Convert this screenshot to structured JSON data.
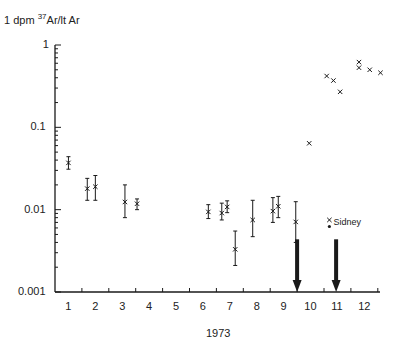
{
  "chart_data": {
    "type": "scatter",
    "title": "",
    "ylabel": "1 dpm 37Ar/lt Ar",
    "ylabel_parts": {
      "prefix": "1 dpm ",
      "sup": "37",
      "suffix": "Ar/lt Ar"
    },
    "xlabel": "1973",
    "yscale": "log",
    "ylim": [
      0.001,
      1
    ],
    "xlim": [
      0,
      12.3
    ],
    "y_ticks": [
      {
        "value": 1,
        "label": "1"
      },
      {
        "value": 0.1,
        "label": "0.1"
      },
      {
        "value": 0.01,
        "label": "0.01"
      },
      {
        "value": 0.001,
        "label": "0.001"
      }
    ],
    "x_tick_labels": [
      "1",
      "2",
      "3",
      "4",
      "5",
      "6",
      "7",
      "8",
      "9",
      "10",
      "11",
      "12"
    ],
    "grid": false,
    "series": [
      {
        "name": "measurements",
        "marker": "x",
        "points": [
          {
            "x": 0.5,
            "y": 0.037,
            "ylo": 0.031,
            "yhi": 0.044
          },
          {
            "x": 1.2,
            "y": 0.018,
            "ylo": 0.013,
            "yhi": 0.024
          },
          {
            "x": 1.5,
            "y": 0.019,
            "ylo": 0.013,
            "yhi": 0.026
          },
          {
            "x": 2.6,
            "y": 0.0124,
            "ylo": 0.008,
            "yhi": 0.02
          },
          {
            "x": 3.05,
            "y": 0.0118,
            "ylo": 0.01,
            "yhi": 0.0135
          },
          {
            "x": 5.7,
            "y": 0.0094,
            "ylo": 0.0078,
            "yhi": 0.0115
          },
          {
            "x": 6.2,
            "y": 0.0091,
            "ylo": 0.0075,
            "yhi": 0.012
          },
          {
            "x": 6.4,
            "y": 0.0108,
            "ylo": 0.0092,
            "yhi": 0.0128
          },
          {
            "x": 6.7,
            "y": 0.0033,
            "ylo": 0.0021,
            "yhi": 0.0055
          },
          {
            "x": 7.35,
            "y": 0.0075,
            "ylo": 0.0047,
            "yhi": 0.013
          },
          {
            "x": 8.1,
            "y": 0.0096,
            "ylo": 0.007,
            "yhi": 0.014
          },
          {
            "x": 8.3,
            "y": 0.011,
            "ylo": 0.008,
            "yhi": 0.0145
          },
          {
            "x": 8.95,
            "y": 0.0071,
            "ylo": 0.004,
            "yhi": 0.0125
          },
          {
            "x": 9.45,
            "y": 0.064
          },
          {
            "x": 10.1,
            "y": 0.42
          },
          {
            "x": 10.35,
            "y": 0.37
          },
          {
            "x": 10.6,
            "y": 0.27
          },
          {
            "x": 11.3,
            "y": 0.62
          },
          {
            "x": 11.3,
            "y": 0.53
          },
          {
            "x": 11.7,
            "y": 0.5
          },
          {
            "x": 12.1,
            "y": 0.46
          }
        ]
      },
      {
        "name": "Sidney",
        "marker": "x+dot",
        "points": [
          {
            "x": 10.2,
            "y": 0.0075,
            "dot_y": 0.0066
          }
        ]
      }
    ],
    "annotations": [
      {
        "type": "text",
        "text": "Sidney",
        "x": 10.35,
        "y": 0.0068
      },
      {
        "type": "arrow-down",
        "x": 9.0,
        "y_from": 0.0033,
        "y_to": 0.001
      },
      {
        "type": "arrow-down",
        "x": 10.45,
        "y_from": 0.0033,
        "y_to": 0.001
      }
    ],
    "legend": null
  },
  "colors": {
    "ink": "#1a1a1a",
    "background": "#ffffff"
  }
}
